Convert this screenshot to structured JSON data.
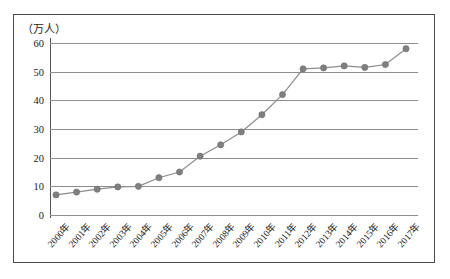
{
  "chart_data": {
    "type": "line",
    "title": "",
    "unit_label": "（万人）",
    "xlabel": "",
    "ylabel": "万人",
    "ylim": [
      0,
      60
    ],
    "yticks": [
      0,
      10,
      20,
      30,
      40,
      50,
      60
    ],
    "grid": true,
    "legend": "none",
    "marker": "circle",
    "line_color": "#8c8c8c",
    "marker_color": "#7f7f7f",
    "categories": [
      "2000年",
      "2001年",
      "2002年",
      "2003年",
      "2004年",
      "2005年",
      "2006年",
      "2007年",
      "2008年",
      "2009年",
      "2010年",
      "2011年",
      "2012年",
      "2013年",
      "2014年",
      "2015年",
      "2016年",
      "2017年"
    ],
    "values": [
      7,
      8,
      9,
      9.8,
      10,
      13,
      15,
      20.5,
      24.5,
      29,
      35,
      42,
      51,
      51.3,
      52,
      51.5,
      52.5,
      58
    ]
  },
  "axes": {
    "unit_label": "（万人）",
    "y_tick_labels": [
      "60",
      "50",
      "40",
      "30",
      "20",
      "10",
      "0"
    ],
    "x_tick_labels": [
      "2000年",
      "2001年",
      "2002年",
      "2003年",
      "2004年",
      "2005年",
      "2006年",
      "2007年",
      "2008年",
      "2009年",
      "2010年",
      "2011年",
      "2012年",
      "2013年",
      "2014年",
      "2015年",
      "2016年",
      "2017年"
    ]
  },
  "colors": {
    "frame": "#4a4a4a",
    "gridline": "#8e8e8e",
    "axis": "#555555",
    "series": "#7f7f7f",
    "text": "#1a1a1a",
    "background": "#ffffff"
  }
}
